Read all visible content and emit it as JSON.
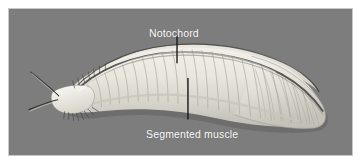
{
  "figure": {
    "background_color": "#7d7d7d",
    "frame_border_color": "#c9c9c9",
    "page_background_color": "#ffffff",
    "label_color": "#ffffff",
    "leader_line_color": "#1a1a1a",
    "organism_body_color": "#e8e6dd",
    "organism_shadow_color": "#5e5e5e",
    "notochord_color": "#4a4a46"
  },
  "labels": {
    "notochord": {
      "text": "Notochord",
      "leader": {
        "x": 177,
        "y1": 35,
        "y2": 63
      }
    },
    "segmented_muscle": {
      "text": "Segmented muscle",
      "leader": {
        "x": 188,
        "y1": 78,
        "y2": 120
      }
    }
  },
  "icons": {
    "notochord_leader": "vertical-leader-line-icon",
    "segmented_muscle_leader": "vertical-leader-line-icon"
  }
}
